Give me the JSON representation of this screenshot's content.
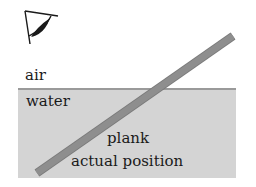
{
  "labels": {
    "air": "air",
    "water": "water",
    "plank": "plank",
    "actual_position": "actual position"
  },
  "icons": {
    "eye": "eye-icon"
  },
  "colors": {
    "water_fill": "#d4d4d4",
    "surface_line": "#9a9a9a",
    "plank_fill": "#8a8a8a",
    "text": "#1a1a1a",
    "eye_stroke": "#1a1a1a"
  }
}
